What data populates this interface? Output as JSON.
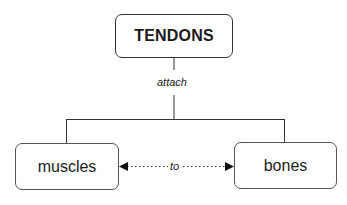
{
  "diagram": {
    "type": "concept-map",
    "nodes": {
      "top": {
        "label": "TENDONS"
      },
      "left": {
        "label": "muscles"
      },
      "right": {
        "label": "bones"
      }
    },
    "links": {
      "top_to_children": {
        "label": "attach"
      },
      "left_right": {
        "label": "to",
        "style": "dotted",
        "arrows": "both"
      }
    },
    "colors": {
      "line": "#333333",
      "node_border": "#555555",
      "background": "#ffffff",
      "text": "#1a1a1a"
    }
  }
}
